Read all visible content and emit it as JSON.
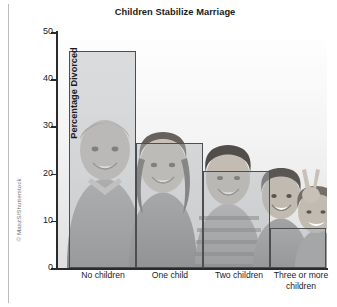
{
  "credit": {
    "text": "© MaszS/Shutterstock"
  },
  "chart_data": {
    "type": "bar",
    "title": "Children Stabilize Marriage",
    "xlabel": "",
    "ylabel": "Percentage Divorced",
    "categories": [
      "No children",
      "One child",
      "Two children",
      "Three or more children"
    ],
    "values": [
      46,
      26.5,
      20.5,
      8.5
    ],
    "ylim": [
      0,
      50
    ],
    "yticks": [
      0,
      10,
      20,
      30,
      40,
      50
    ],
    "ytick_labels": [
      "0",
      "10",
      "20",
      "30",
      "40",
      "50"
    ],
    "grid": false,
    "legend": null,
    "bar_style": {
      "fill": "#b0b3b7",
      "fill_opacity": 0.45,
      "edge": "#4b4e52",
      "gap": 0
    },
    "background_image": "grayscale photo of four smiling children behind the bars",
    "annotations": []
  }
}
